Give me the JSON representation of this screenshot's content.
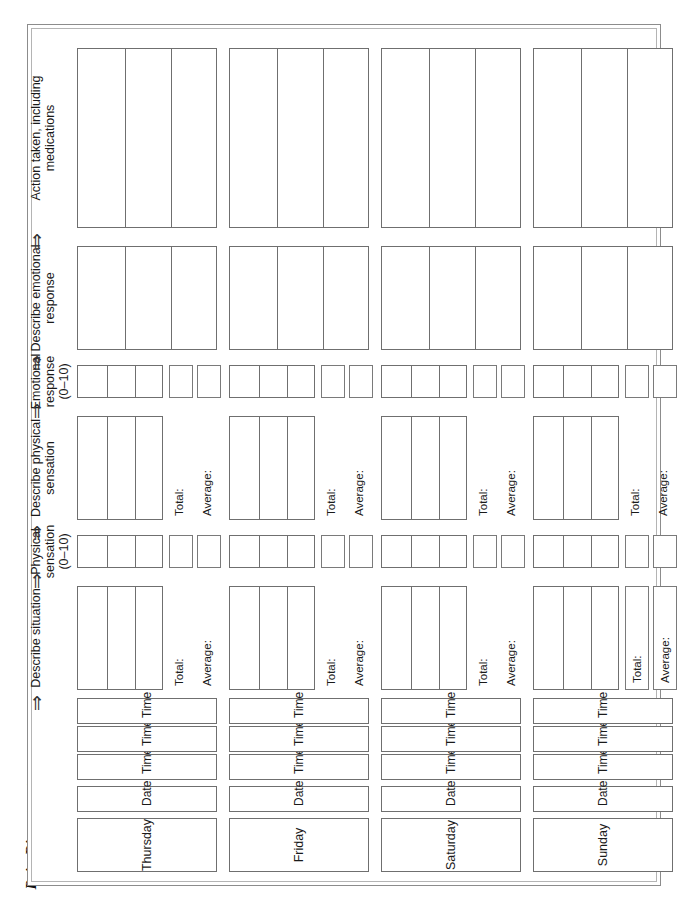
{
  "document": {
    "title": "Pain Diary",
    "title_suffix": "(cont.)",
    "page_background": "#ffffff",
    "rule_color": "#7a7a7a"
  },
  "columns": [
    {
      "id": "describe-situation",
      "label": "Describe situation",
      "arrow": "⇒",
      "type": "wide",
      "has_total_average": true
    },
    {
      "id": "physical-rating",
      "label": "Physical\nsensation\n(0–10)",
      "arrow": "⇒",
      "type": "narrow",
      "has_total_average": false
    },
    {
      "id": "describe-physical",
      "label": "Describe physical\nsensation",
      "arrow": "⇒",
      "type": "wide",
      "has_total_average": true
    },
    {
      "id": "emotional-rating",
      "label": "Emotional\nresponse\n(0–10)",
      "arrow": "⇒",
      "type": "narrow",
      "has_total_average": false
    },
    {
      "id": "describe-emotional",
      "label": "Describe emotional\nresponse",
      "arrow": "⇒",
      "type": "wide",
      "has_total_average": false
    },
    {
      "id": "action-taken",
      "label": "Action taken, including\nmedications",
      "arrow": "⇒",
      "type": "wide",
      "has_total_average": false
    }
  ],
  "summary_labels": {
    "total": "Total:",
    "average": "Average:"
  },
  "row_labels": {
    "date": "Date:",
    "time1": "Time 1:",
    "time2": "Time 2:",
    "time3": "Time 3:"
  },
  "days": [
    {
      "id": "thursday",
      "name": "Thursday",
      "date_value": "",
      "times": [
        "",
        "",
        ""
      ]
    },
    {
      "id": "friday",
      "name": "Friday",
      "date_value": "",
      "times": [
        "",
        "",
        ""
      ]
    },
    {
      "id": "saturday",
      "name": "Saturday",
      "date_value": "",
      "times": [
        "",
        "",
        ""
      ]
    },
    {
      "id": "sunday",
      "name": "Sunday",
      "date_value": "",
      "times": [
        "",
        "",
        ""
      ]
    }
  ]
}
